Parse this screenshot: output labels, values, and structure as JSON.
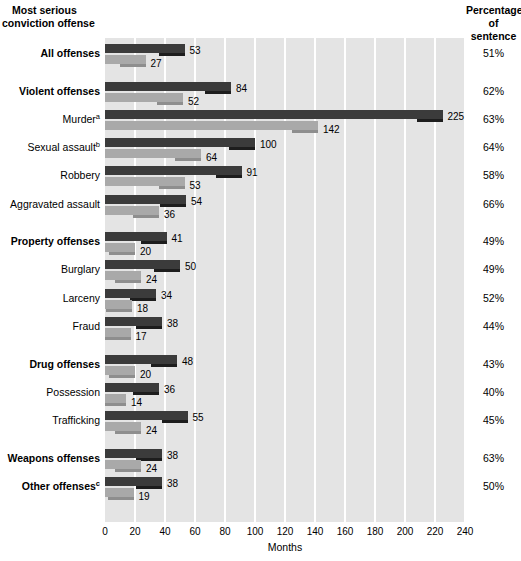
{
  "header": {
    "left_line1": "Most serious",
    "left_line2": "conviction offense",
    "right_line1": "Percentage",
    "right_line2": "of",
    "right_line3": "sentence"
  },
  "axis": {
    "title": "Months",
    "ticks": [
      "0",
      "20",
      "40",
      "60",
      "80",
      "100",
      "120",
      "140",
      "160",
      "180",
      "200",
      "220",
      "240"
    ]
  },
  "colors": {
    "dark_bar": "#3b3b3b",
    "light_bar": "#a9a9a9",
    "plot_background": "#e4e4e4",
    "gridline": "#ffffff"
  },
  "chart_data": {
    "type": "bar",
    "title": "",
    "xlabel": "Months",
    "ylabel": "Most serious conviction offense",
    "xlim": [
      0,
      240
    ],
    "xticks": [
      0,
      20,
      40,
      60,
      80,
      100,
      120,
      140,
      160,
      180,
      200,
      220,
      240
    ],
    "grid": "vertical",
    "legend": "none",
    "orientation": "horizontal",
    "series": [
      {
        "name": "Mean sentence length",
        "key": "dark"
      },
      {
        "name": "Mean time served",
        "key": "light"
      }
    ],
    "categories": [
      "All offenses",
      "Violent offenses",
      "Murder",
      "Sexual assault",
      "Robbery",
      "Aggravated assault",
      "Property offenses",
      "Burglary",
      "Larceny",
      "Fraud",
      "Drug offenses",
      "Possession",
      "Trafficking",
      "Weapons offenses",
      "Other offenses"
    ],
    "rows": [
      {
        "label": "All offenses",
        "footnote": "",
        "bold": true,
        "group_gap": false,
        "dark": 53,
        "light": 27,
        "pct": "51%"
      },
      {
        "label": "Violent offenses",
        "footnote": "",
        "bold": true,
        "group_gap": true,
        "dark": 84,
        "light": 52,
        "pct": "62%"
      },
      {
        "label": "Murder",
        "footnote": "a",
        "bold": false,
        "group_gap": false,
        "dark": 225,
        "light": 142,
        "pct": "63%"
      },
      {
        "label": "Sexual assault",
        "footnote": "b",
        "bold": false,
        "group_gap": false,
        "dark": 100,
        "light": 64,
        "pct": "64%"
      },
      {
        "label": "Robbery",
        "footnote": "",
        "bold": false,
        "group_gap": false,
        "dark": 91,
        "light": 53,
        "pct": "58%"
      },
      {
        "label": "Aggravated assault",
        "footnote": "",
        "bold": false,
        "group_gap": false,
        "dark": 54,
        "light": 36,
        "pct": "66%"
      },
      {
        "label": "Property offenses",
        "footnote": "",
        "bold": true,
        "group_gap": true,
        "dark": 41,
        "light": 20,
        "pct": "49%"
      },
      {
        "label": "Burglary",
        "footnote": "",
        "bold": false,
        "group_gap": false,
        "dark": 50,
        "light": 24,
        "pct": "49%"
      },
      {
        "label": "Larceny",
        "footnote": "",
        "bold": false,
        "group_gap": false,
        "dark": 34,
        "light": 18,
        "pct": "52%"
      },
      {
        "label": "Fraud",
        "footnote": "",
        "bold": false,
        "group_gap": false,
        "dark": 38,
        "light": 17,
        "pct": "44%"
      },
      {
        "label": "Drug offenses",
        "footnote": "",
        "bold": true,
        "group_gap": true,
        "dark": 48,
        "light": 20,
        "pct": "43%"
      },
      {
        "label": "Possession",
        "footnote": "",
        "bold": false,
        "group_gap": false,
        "dark": 36,
        "light": 14,
        "pct": "40%"
      },
      {
        "label": "Trafficking",
        "footnote": "",
        "bold": false,
        "group_gap": false,
        "dark": 55,
        "light": 24,
        "pct": "45%"
      },
      {
        "label": "Weapons offenses",
        "footnote": "",
        "bold": true,
        "group_gap": true,
        "dark": 38,
        "light": 24,
        "pct": "63%"
      },
      {
        "label": "Other offenses",
        "footnote": "c",
        "bold": true,
        "group_gap": false,
        "dark": 38,
        "light": 19,
        "pct": "50%"
      }
    ]
  }
}
